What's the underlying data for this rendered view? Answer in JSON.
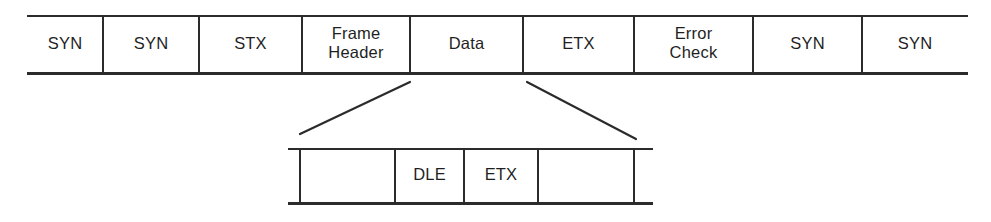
{
  "diagram": {
    "type": "protocol-frame-layout",
    "colors": {
      "background": "#ffffff",
      "line": "#2b2b2b",
      "text": "#1f1f1f"
    },
    "frame_row": {
      "name": "top-frame-row",
      "x_start": 27,
      "x_end": 968,
      "y_top": 15,
      "y_bottom": 74,
      "open_ends": true,
      "dividers": [
        103,
        199,
        302,
        410,
        523,
        634,
        753,
        862
      ],
      "cells": [
        {
          "label": "SYN",
          "lines": [
            "SYN"
          ],
          "x_left": 27,
          "x_right": 103
        },
        {
          "label": "SYN",
          "lines": [
            "SYN"
          ],
          "x_left": 103,
          "x_right": 199
        },
        {
          "label": "STX",
          "lines": [
            "STX"
          ],
          "x_left": 199,
          "x_right": 302
        },
        {
          "label": "Frame Header",
          "lines": [
            "Frame",
            "Header"
          ],
          "x_left": 302,
          "x_right": 410
        },
        {
          "label": "Data",
          "lines": [
            "Data"
          ],
          "x_left": 410,
          "x_right": 523
        },
        {
          "label": "ETX",
          "lines": [
            "ETX"
          ],
          "x_left": 523,
          "x_right": 634
        },
        {
          "label": "Error Check",
          "lines": [
            "Error",
            "Check"
          ],
          "x_left": 634,
          "x_right": 753
        },
        {
          "label": "SYN",
          "lines": [
            "SYN"
          ],
          "x_left": 753,
          "x_right": 862
        },
        {
          "label": "SYN",
          "lines": [
            "SYN"
          ],
          "x_left": 862,
          "x_right": 968
        }
      ]
    },
    "detail_row": {
      "name": "data-field-expansion-row",
      "x_start": 288,
      "x_end": 653,
      "y_top": 148,
      "y_bottom": 204,
      "left_edge_x": 300,
      "right_edge_x": 634,
      "dividers": [
        395,
        464,
        538
      ],
      "cells": [
        {
          "label": "",
          "lines": [],
          "x_left": 300,
          "x_right": 395
        },
        {
          "label": "DLE",
          "lines": [
            "DLE"
          ],
          "x_left": 395,
          "x_right": 464
        },
        {
          "label": "ETX",
          "lines": [
            "ETX"
          ],
          "x_left": 464,
          "x_right": 538
        },
        {
          "label": "",
          "lines": [],
          "x_left": 538,
          "x_right": 634
        }
      ]
    },
    "connectors": [
      {
        "name": "left-expansion-connector",
        "x1": 410,
        "y1": 82,
        "x2": 300,
        "y2": 134
      },
      {
        "name": "right-expansion-connector",
        "x1": 527,
        "y1": 82,
        "x2": 636,
        "y2": 139
      }
    ]
  }
}
